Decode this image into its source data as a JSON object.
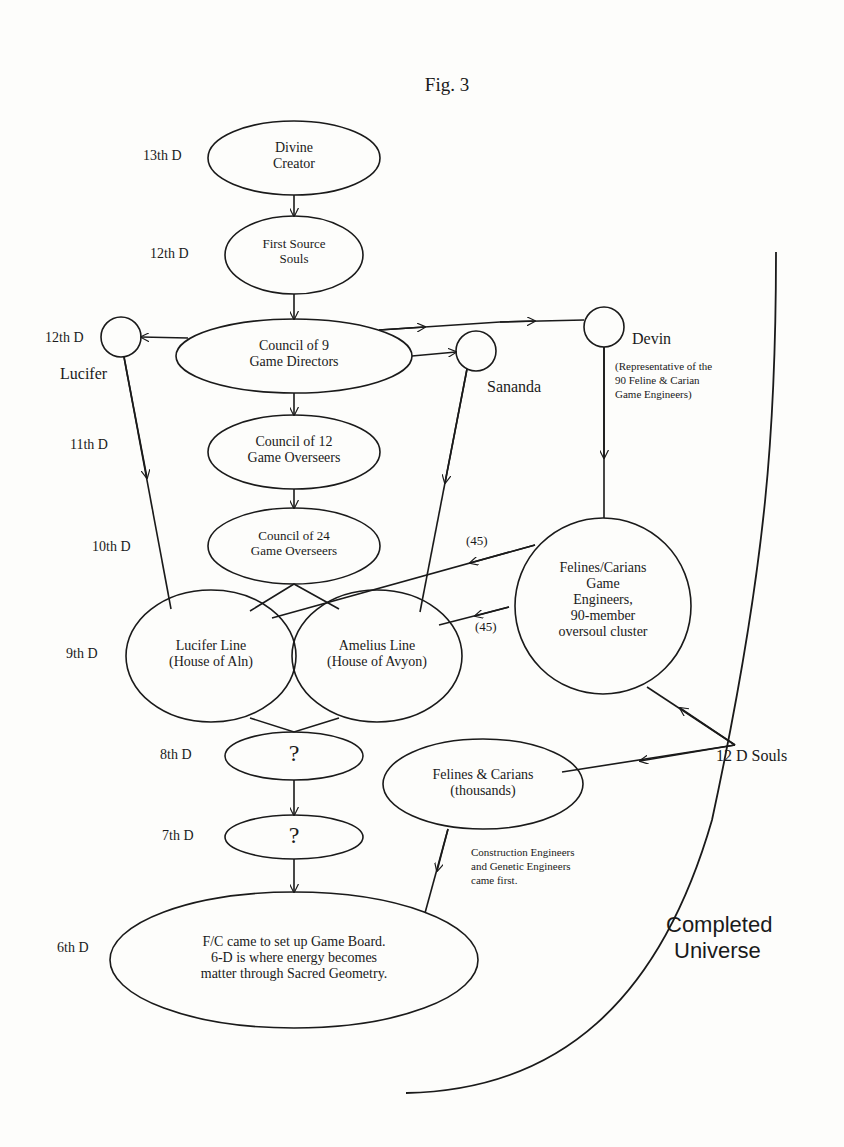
{
  "figure": {
    "title": "Fig. 3"
  },
  "dimensions": {
    "d13": "13th D",
    "d12a": "12th D",
    "d12b": "12th D",
    "d11": "11th D",
    "d10": "10th D",
    "d9": "9th D",
    "d8": "8th D",
    "d7": "7th D",
    "d6": "6th D"
  },
  "nodes": {
    "divine_creator": {
      "line1": "Divine",
      "line2": "Creator"
    },
    "first_source": {
      "line1": "First Source",
      "line2": "Souls"
    },
    "council9": {
      "line1": "Council of 9",
      "line2": "Game Directors"
    },
    "council12": {
      "line1": "Council of 12",
      "line2": "Game Overseers"
    },
    "council24": {
      "line1": "Council of 24",
      "line2": "Game Overseers"
    },
    "lucifer_line": {
      "line1": "Lucifer Line",
      "line2": "(House of Aln)"
    },
    "amelius_line": {
      "line1": "Amelius Line",
      "line2": "(House of Avyon)"
    },
    "felines_cluster": {
      "line1": "Felines/Carians",
      "line2": "Game",
      "line3": "Engineers,",
      "line4": "90-member",
      "line5": "oversoul cluster"
    },
    "unknown8": {
      "label": "?"
    },
    "unknown7": {
      "label": "?"
    },
    "felines_thousands": {
      "line1": "Felines & Carians",
      "line2": "(thousands)"
    },
    "game_board": {
      "line1": "F/C came to set up Game Board.",
      "line2": "6-D is where energy becomes",
      "line3": "matter through Sacred Geometry."
    }
  },
  "beings": {
    "lucifer": "Lucifer",
    "sananda": "Sananda",
    "devin": "Devin",
    "devin_note": {
      "line1": "(Representative of the",
      "line2": "90 Feline & Carian",
      "line3": "Game Engineers)"
    }
  },
  "edge_labels": {
    "upper45": "(45)",
    "lower45": "(45)",
    "souls12d": "12 D Souls"
  },
  "notes": {
    "engineers": {
      "line1": "Construction Engineers",
      "line2": "and Genetic Engineers",
      "line3": "came first."
    }
  },
  "regions": {
    "completed_universe": {
      "line1": "Completed",
      "line2": "Universe"
    }
  },
  "colors": {
    "ink": "#1a1a1a",
    "paper": "#fdfdfb"
  }
}
